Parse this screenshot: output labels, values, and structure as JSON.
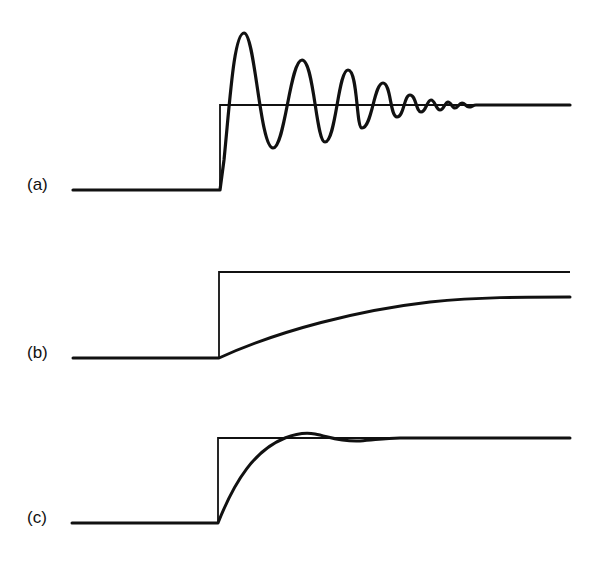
{
  "figure": {
    "panels": [
      {
        "id": "a",
        "label": "(a)",
        "label_pos": [
          27,
          196
        ],
        "description": "Underdamped oscillatory response to step",
        "baseline_y": 190,
        "setpoint_y": 105,
        "step_x": 220,
        "start_x": 73,
        "end_x": 570,
        "response_path": "M73,190 L220,190 L224,160 C230,100 234,33 244,33 C255,33 260,148 273,148 C285,148 290,60 302,60 C314,60 316,142 325,142 C336,142 338,70 348,70 C358,70 356,128 362,128 C372,128 374,83 383,83 C391,83 390,117 397,117 C404,117 404,95 410,95 C416,95 416,112 421,112 C426,112 427,100 431,100 C435,100 436,110 440,110 C444,110 445,102 448,102 C451,102 452,108 455,108 C458,108 459,103 462,103 C465,103 466,107 469,107 C472,107 473,105 476,105 L570,105",
        "setpoint_path": "M220,190 L220,105 L570,105"
      },
      {
        "id": "b",
        "label": "(b)",
        "label_pos": [
          27,
          364
        ],
        "description": "Overdamped slow exponential response to step",
        "baseline_y": 358,
        "setpoint_y": 272,
        "step_x": 219,
        "start_x": 73,
        "end_x": 570,
        "response_path": "M73,358 L219,358 C280,330 360,310 430,302 C480,297 520,297 570,297",
        "setpoint_path": "M219,358 L219,272 L570,272"
      },
      {
        "id": "c",
        "label": "(c)",
        "label_pos": [
          27,
          529
        ],
        "description": "Nearly critically damped response with slight overshoot",
        "baseline_y": 523,
        "setpoint_y": 438,
        "step_x": 218,
        "start_x": 72,
        "end_x": 570,
        "response_path": "M72,523 L218,523 C235,480 255,450 285,438 C295,434 305,432 315,434 C330,437 340,442 360,441 C375,440 385,438 400,438 L570,438",
        "setpoint_path": "M218,523 L218,438 L570,438"
      }
    ]
  },
  "colors": {
    "background": "#ffffff",
    "stroke": "#111111"
  }
}
